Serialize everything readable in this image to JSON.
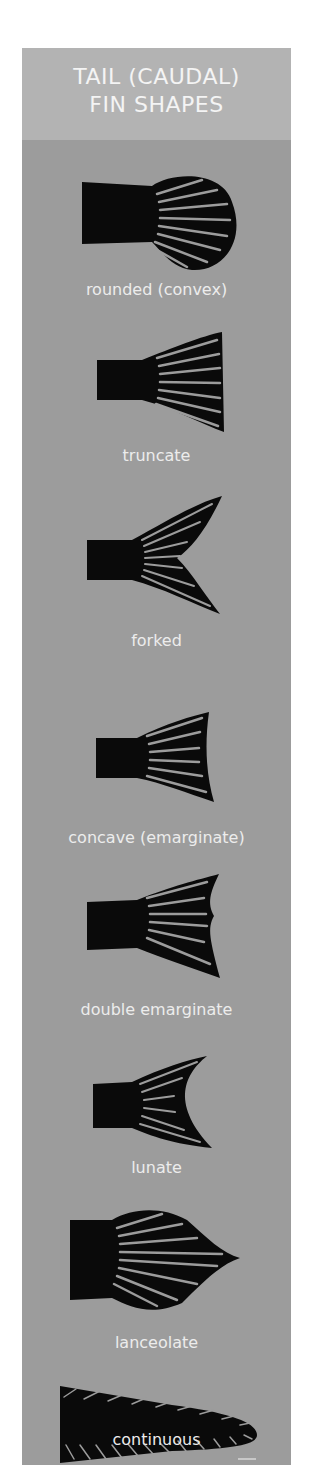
{
  "title": {
    "line1": "TAIL (CAUDAL)",
    "line2": "FIN SHAPES"
  },
  "colors": {
    "header_bg": "#b3b3b3",
    "panel_bg": "#9c9c9c",
    "fin": "#0a0a0a",
    "text": "#ececec"
  },
  "fins": [
    {
      "id": "rounded",
      "label": "rounded (convex)"
    },
    {
      "id": "truncate",
      "label": "truncate"
    },
    {
      "id": "forked",
      "label": "forked"
    },
    {
      "id": "concave",
      "label": "concave (emarginate)"
    },
    {
      "id": "double-emarginate",
      "label": "double emarginate"
    },
    {
      "id": "lunate",
      "label": "lunate"
    },
    {
      "id": "lanceolate",
      "label": "lanceolate"
    },
    {
      "id": "continuous",
      "label": "continuous"
    }
  ]
}
